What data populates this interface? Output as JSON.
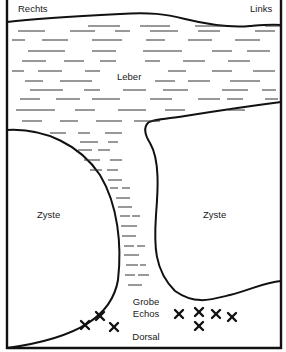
{
  "labels": {
    "right_side": "Rechts",
    "left_side": "Links",
    "liver": "Leber",
    "cyst_left": "Zyste",
    "cyst_right": "Zyste",
    "coarse_echoes_line1": "Grobe",
    "coarse_echoes_line2": "Echos",
    "dorsal": "Dorsal"
  },
  "markers": {
    "symbol": "x-mark-icon",
    "left_group_count": 3,
    "right_group_count": 5
  },
  "colors": {
    "line": "#111111",
    "background": "#ffffff",
    "text": "#1a1a1a"
  }
}
